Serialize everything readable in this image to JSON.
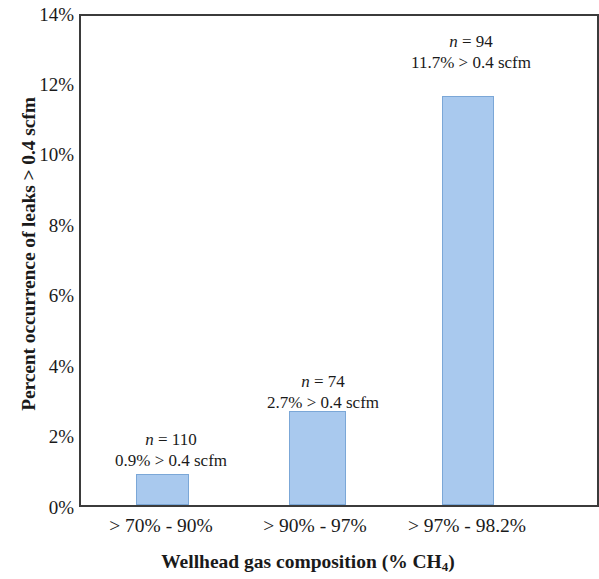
{
  "chart_data": {
    "type": "bar",
    "title": "",
    "xlabel": "Wellhead gas composition (% CH4)",
    "xlabel_main": "Wellhead gas composition (% CH",
    "xlabel_sub": "4",
    "xlabel_tail": ")",
    "ylabel": "Percent occurrence of leaks > 0.4 scfm",
    "categories": [
      "> 70% - 90%",
      "> 90% - 97%",
      "> 97% - 98.2%"
    ],
    "values": [
      0.9,
      2.7,
      11.7
    ],
    "value_labels": [
      "0.9% > 0.4 scfm",
      "2.7% > 0.4 scfm",
      "11.7% > 0.4 scfm"
    ],
    "counts": [
      "n = 110",
      "n = 74",
      "n = 94"
    ],
    "count_n": [
      "n",
      "n",
      "n"
    ],
    "count_eq": [
      " = 110",
      " = 74",
      " = 94"
    ],
    "ylim": [
      0,
      14
    ],
    "ytick_labels": [
      "14%",
      "12%",
      "10%",
      "8%",
      "6%",
      "4%",
      "2%",
      "0%"
    ],
    "ytick_values": [
      14,
      12,
      10,
      8,
      6,
      4,
      2,
      0
    ],
    "grid": false,
    "legend": "none",
    "bar_color": "#a9c9ee",
    "bar_border_color": "#7ba7d7",
    "axis_color": "#3b3b3b"
  }
}
